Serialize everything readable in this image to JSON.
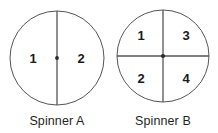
{
  "canvas": {
    "width": 218,
    "height": 133,
    "background_color": "#ffffff"
  },
  "style": {
    "outline_color": "#555555",
    "divider_color": "#555555",
    "hub_color": "#2b2b2b",
    "digit_color": "#1a1a1a",
    "caption_color": "#1f1f1f"
  },
  "spinners": [
    {
      "id": "spinner-a",
      "caption": "Spinner A",
      "center_x": 57,
      "center_y": 58,
      "radius": 47,
      "divisions": 2,
      "dividers": [
        "vertical"
      ],
      "sectors": [
        {
          "name": "left-half",
          "value": "1",
          "x": 33,
          "y": 58
        },
        {
          "name": "right-half",
          "value": "2",
          "x": 81,
          "y": 58
        }
      ]
    },
    {
      "id": "spinner-b",
      "caption": "Spinner B",
      "center_x": 163,
      "center_y": 56,
      "radius": 46,
      "divisions": 4,
      "dividers": [
        "vertical",
        "horizontal"
      ],
      "sectors": [
        {
          "name": "top-left-quadrant",
          "value": "1",
          "x": 141,
          "y": 35
        },
        {
          "name": "top-right-quadrant",
          "value": "3",
          "x": 186,
          "y": 35
        },
        {
          "name": "bottom-left-quadrant",
          "value": "2",
          "x": 141,
          "y": 78
        },
        {
          "name": "bottom-right-quadrant",
          "value": "4",
          "x": 186,
          "y": 78
        }
      ]
    }
  ],
  "captions": [
    {
      "text": "Spinner A",
      "center_x": 57,
      "top": 114
    },
    {
      "text": "Spinner B",
      "center_x": 163,
      "top": 114
    }
  ]
}
